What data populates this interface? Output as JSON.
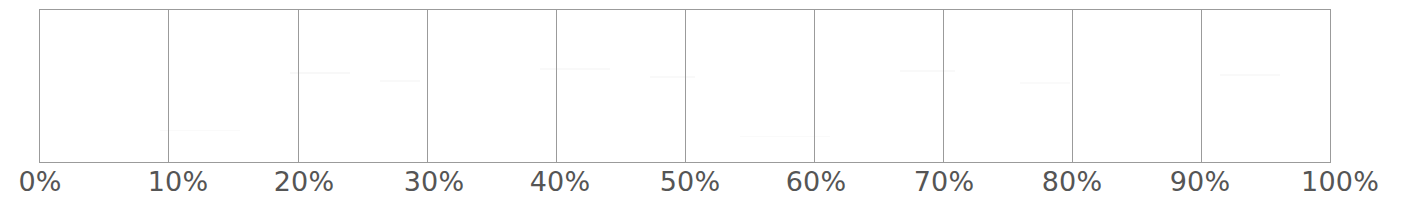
{
  "figure": {
    "kind": "axis-scale",
    "background_color": "#ffffff",
    "width": 1404,
    "height": 215
  },
  "plot_area": {
    "border_color": "#9b9b9b",
    "border_width_px": 1,
    "fill_color": "#ffffff",
    "left_px": 39,
    "top_px": 9,
    "width_px": 1292,
    "height_px": 154,
    "content": ""
  },
  "axis": {
    "orientation": "horizontal",
    "label_color": "#555555",
    "label_font_size_px": 27,
    "grid_color": "#9b9b9b",
    "gridlines_vertical": true,
    "gridlines_horizontal": false,
    "tick_count": 11,
    "tick_values": [
      0,
      10,
      20,
      30,
      40,
      50,
      60,
      70,
      80,
      90,
      100
    ],
    "tick_labels": [
      "0%",
      "10%",
      "20%",
      "30%",
      "40%",
      "50%",
      "60%",
      "70%",
      "80%",
      "90%",
      "100%"
    ],
    "tick_label_centers_px": [
      40,
      178,
      304,
      434,
      560,
      690,
      816,
      944,
      1072,
      1200,
      1340
    ],
    "gridline_positions_px": [
      39,
      168,
      298,
      427,
      556,
      685,
      814,
      943,
      1072,
      1201,
      1330
    ]
  },
  "chart_data": {
    "type": "bar",
    "title": "",
    "subtitle": "",
    "xlabel": "",
    "ylabel": "",
    "xlim": [
      0,
      100
    ],
    "ylim": [
      0,
      1
    ],
    "grid": true,
    "grid_axis": "x",
    "legend": false,
    "legend_position": "none",
    "annotations": [],
    "x_tick_labels": [
      "0%",
      "10%",
      "20%",
      "30%",
      "40%",
      "50%",
      "60%",
      "70%",
      "80%",
      "90%",
      "100%"
    ],
    "x_tick_values": [
      0,
      10,
      20,
      30,
      40,
      50,
      60,
      70,
      80,
      90,
      100
    ],
    "y_tick_labels": [],
    "y_tick_values": [],
    "categories": [],
    "values": [],
    "series": [],
    "note": "Empty percentage scale: framed plot box with 9 interior vertical gridlines at every 10% and no plotted data."
  }
}
